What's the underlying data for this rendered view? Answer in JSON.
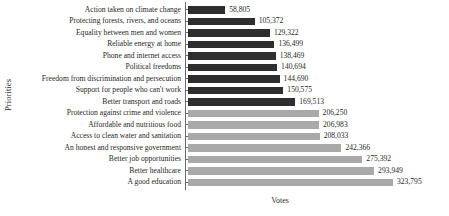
{
  "chart_data": {
    "type": "bar",
    "orientation": "horizontal",
    "title": "",
    "xlabel": "Votes",
    "ylabel": "Priorities",
    "grid": false,
    "legend": null,
    "xlim": [
      0,
      323795
    ],
    "categories": [
      "Action taken on climate change",
      "Protecting forests, rivers, and oceans",
      "Equality between men and women",
      "Reliable energy at home",
      "Phone and internet access",
      "Political freedoms",
      "Freedom from discrimination and persecution",
      "Support for people who can't work",
      "Better transport and roads",
      "Protection against crime and violence",
      "Affordable and nutritious food",
      "Access to clean water and sanitation",
      "An honest and responsive government",
      "Better job opportunities",
      "Better healthcare",
      "A good education"
    ],
    "values": [
      58805,
      105372,
      129322,
      136499,
      138469,
      140694,
      144690,
      150575,
      169513,
      206250,
      206983,
      208033,
      242366,
      275392,
      293949,
      323795
    ],
    "value_labels": [
      "58,805",
      "105,372",
      "129,322",
      "136,499",
      "138,469",
      "140,694",
      "144,690",
      "150,575",
      "169,513",
      "206,250",
      "206,983",
      "208,033",
      "242,366",
      "275,392",
      "293,949",
      "323,795"
    ],
    "bar_colors": [
      "#2e2e2e",
      "#2e2e2e",
      "#2e2e2e",
      "#2e2e2e",
      "#2e2e2e",
      "#2e2e2e",
      "#2e2e2e",
      "#2e2e2e",
      "#2e2e2e",
      "#a9a9a9",
      "#a9a9a9",
      "#a9a9a9",
      "#a9a9a9",
      "#a9a9a9",
      "#a9a9a9",
      "#a9a9a9"
    ],
    "colors": {
      "dark_series": "#2e2e2e",
      "light_series": "#a9a9a9",
      "axis": "#6a6a6a",
      "text": "#1f1f1f",
      "background": "#ffffff"
    }
  }
}
